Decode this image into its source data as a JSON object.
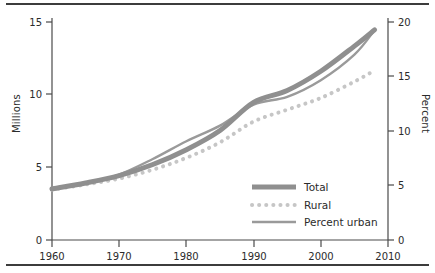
{
  "chart_data": {
    "type": "line",
    "title": "",
    "xlabel": "",
    "ylabel": "Millions",
    "y2label": "Percent",
    "xlim": [
      1960,
      2010
    ],
    "ylim": [
      0,
      15
    ],
    "y2lim": [
      0,
      20
    ],
    "grid": false,
    "legend_position": "bottom-right",
    "xticks": [
      "1960",
      "1970",
      "1980",
      "1990",
      "2000",
      "2010"
    ],
    "xtick_values": [
      1960,
      1970,
      1980,
      1990,
      2000,
      2010
    ],
    "yticks": [
      "0",
      "5",
      "10",
      "15"
    ],
    "ytick_values": [
      0,
      5,
      10,
      15
    ],
    "y2ticks": [
      "0",
      "5",
      "10",
      "15",
      "20"
    ],
    "y2tick_values": [
      0,
      5,
      10,
      15,
      20
    ],
    "x": [
      1960,
      1965,
      1970,
      1975,
      1980,
      1985,
      1990,
      1995,
      2000,
      2005,
      2008
    ],
    "series": [
      {
        "name": "Total",
        "axis": "left",
        "units": "millions",
        "color": "#8f8f8f",
        "style": "thick-solid",
        "values": [
          3.45,
          3.85,
          4.35,
          5.1,
          6.1,
          7.4,
          9.3,
          10.1,
          11.4,
          13.1,
          14.2
        ]
      },
      {
        "name": "Rural",
        "axis": "left",
        "units": "millions",
        "color": "#c6c6c6",
        "style": "dotted",
        "values": [
          3.4,
          3.75,
          4.15,
          4.75,
          5.55,
          6.6,
          8.0,
          8.8,
          9.6,
          10.7,
          11.45
        ]
      },
      {
        "name": "Percent urban",
        "axis": "right",
        "units": "percent",
        "color": "#9a9a9a",
        "style": "thin-solid",
        "values": [
          4.6,
          5.1,
          5.9,
          7.3,
          8.9,
          10.3,
          12.2,
          12.9,
          14.4,
          16.7,
          18.9
        ]
      }
    ],
    "legend": [
      {
        "label": "Total",
        "style": "thick-solid",
        "color": "#8f8f8f"
      },
      {
        "label": "Rural",
        "style": "dotted",
        "color": "#c6c6c6"
      },
      {
        "label": "Percent urban",
        "style": "thin-solid",
        "color": "#9a9a9a"
      }
    ]
  },
  "axes": {
    "left_title": "Millions",
    "right_title": "Percent",
    "x_ticks": [
      "1960",
      "1970",
      "1980",
      "1990",
      "2000",
      "2010"
    ],
    "y_left_ticks": [
      "15",
      "10",
      "5",
      "0"
    ],
    "y_right_ticks": [
      "20",
      "15",
      "10",
      "5",
      "0"
    ]
  },
  "legend": {
    "items": [
      {
        "label": "Total"
      },
      {
        "label": "Rural"
      },
      {
        "label": "Percent urban"
      }
    ]
  }
}
